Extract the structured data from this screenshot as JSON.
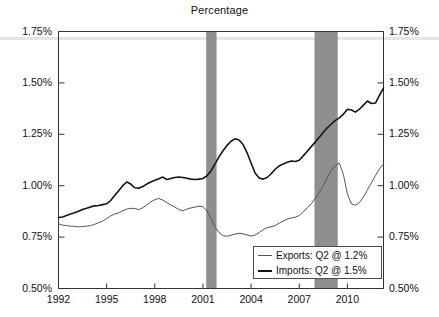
{
  "chart": {
    "title": "Percentage",
    "legend_position": "bottom-right",
    "grid": false
  },
  "axes": {
    "y_ticks": [
      "0.50%",
      "0.75%",
      "1.00%",
      "1.25%",
      "1.50%",
      "1.75%"
    ],
    "x_ticks": [
      "1992",
      "1995",
      "1998",
      "2001",
      "2004",
      "2007",
      "2010"
    ],
    "ylim": [
      0.5,
      1.75
    ],
    "xlim": [
      1992,
      2012.25
    ]
  },
  "legend": {
    "entries": [
      {
        "label": "Exports: Q2 @ 1.2%",
        "color": "#555555",
        "icon": "line-swatch-icon"
      },
      {
        "label": "Imports: Q2 @ 1.5%",
        "color": "#141414",
        "icon": "line-swatch-icon"
      }
    ]
  },
  "colors": {
    "exports_line": "#555555",
    "imports_line": "#141414",
    "recession_band": "#8f8f8f",
    "axis": "#333333",
    "top_band": "#e6e6e6"
  },
  "chart_data": {
    "type": "line",
    "title": "Percentage",
    "xlabel": "",
    "ylabel": "Percentage",
    "ylim": [
      0.5,
      1.75
    ],
    "xlim": [
      1992,
      2012.25
    ],
    "grid": false,
    "legend_position": "bottom-right",
    "x_tick_labels": [
      "1992",
      "1995",
      "1998",
      "2001",
      "2004",
      "2007",
      "2010"
    ],
    "y_tick_labels": [
      "0.50%",
      "0.75%",
      "1.00%",
      "1.25%",
      "1.50%",
      "1.75%"
    ],
    "recession_bands": [
      {
        "start": 2001.2,
        "end": 2001.85
      },
      {
        "start": 2007.95,
        "end": 2009.4
      }
    ],
    "x": [
      1992.0,
      1992.25,
      1992.5,
      1992.75,
      1993.0,
      1993.25,
      1993.5,
      1993.75,
      1994.0,
      1994.25,
      1994.5,
      1994.75,
      1995.0,
      1995.25,
      1995.5,
      1995.75,
      1996.0,
      1996.25,
      1996.5,
      1996.75,
      1997.0,
      1997.25,
      1997.5,
      1997.75,
      1998.0,
      1998.25,
      1998.5,
      1998.75,
      1999.0,
      1999.25,
      1999.5,
      1999.75,
      2000.0,
      2000.25,
      2000.5,
      2000.75,
      2001.0,
      2001.25,
      2001.5,
      2001.75,
      2002.0,
      2002.25,
      2002.5,
      2002.75,
      2003.0,
      2003.25,
      2003.5,
      2003.75,
      2004.0,
      2004.25,
      2004.5,
      2004.75,
      2005.0,
      2005.25,
      2005.5,
      2005.75,
      2006.0,
      2006.25,
      2006.5,
      2006.75,
      2007.0,
      2007.25,
      2007.5,
      2007.75,
      2008.0,
      2008.25,
      2008.5,
      2008.75,
      2009.0,
      2009.25,
      2009.5,
      2009.75,
      2010.0,
      2010.25,
      2010.5,
      2010.75,
      2011.0,
      2011.25,
      2011.5,
      2011.75,
      2012.0,
      2012.25
    ],
    "series": [
      {
        "name": "Exports",
        "color": "#555555",
        "linewidth": 1,
        "last_label": "Q2 @ 1.2%",
        "values": [
          0.815,
          0.808,
          0.806,
          0.803,
          0.802,
          0.8,
          0.801,
          0.803,
          0.806,
          0.812,
          0.82,
          0.828,
          0.84,
          0.853,
          0.862,
          0.868,
          0.878,
          0.886,
          0.89,
          0.889,
          0.884,
          0.893,
          0.906,
          0.921,
          0.932,
          0.938,
          0.93,
          0.918,
          0.906,
          0.896,
          0.884,
          0.878,
          0.886,
          0.892,
          0.896,
          0.9,
          0.898,
          0.878,
          0.84,
          0.8,
          0.772,
          0.757,
          0.754,
          0.759,
          0.765,
          0.768,
          0.766,
          0.76,
          0.755,
          0.76,
          0.772,
          0.786,
          0.796,
          0.8,
          0.806,
          0.818,
          0.828,
          0.838,
          0.843,
          0.847,
          0.855,
          0.872,
          0.892,
          0.912,
          0.938,
          0.968,
          1.0,
          1.04,
          1.075,
          1.098,
          1.11,
          1.055,
          0.96,
          0.912,
          0.905,
          0.918,
          0.945,
          0.98,
          1.015,
          1.05,
          1.082,
          1.105
        ]
      },
      {
        "name": "Imports",
        "color": "#141414",
        "linewidth": 1.6,
        "last_label": "Q2 @ 1.5%",
        "values": [
          0.845,
          0.848,
          0.855,
          0.862,
          0.868,
          0.876,
          0.884,
          0.89,
          0.897,
          0.902,
          0.904,
          0.908,
          0.912,
          0.928,
          0.952,
          0.976,
          1.0,
          1.018,
          1.008,
          0.99,
          0.988,
          0.996,
          1.008,
          1.018,
          1.026,
          1.034,
          1.042,
          1.03,
          1.035,
          1.04,
          1.042,
          1.04,
          1.036,
          1.032,
          1.03,
          1.032,
          1.035,
          1.048,
          1.072,
          1.105,
          1.14,
          1.17,
          1.196,
          1.216,
          1.228,
          1.222,
          1.2,
          1.16,
          1.11,
          1.062,
          1.038,
          1.032,
          1.04,
          1.058,
          1.08,
          1.096,
          1.106,
          1.114,
          1.12,
          1.118,
          1.124,
          1.145,
          1.168,
          1.19,
          1.212,
          1.236,
          1.26,
          1.282,
          1.3,
          1.318,
          1.33,
          1.348,
          1.372,
          1.368,
          1.358,
          1.372,
          1.392,
          1.412,
          1.4,
          1.402,
          1.44,
          1.475
        ]
      }
    ]
  }
}
